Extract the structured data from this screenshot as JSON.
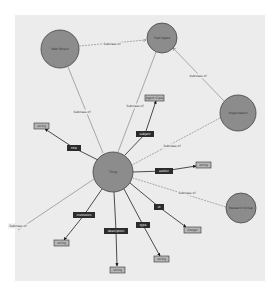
{
  "colors": {
    "background": "#ffffff",
    "panel": "#ececec",
    "class_fill": "#8c8c8c",
    "class_stroke": "#444444",
    "property_fill": "#2b2b2b",
    "datatype_fill": "#b5b5b5",
    "datatype_stroke": "#333333",
    "subclass_edge": "#777777",
    "property_edge": "#222222"
  },
  "classes": [
    {
      "id": "center",
      "label": "Thing",
      "cx": 113,
      "cy": 172,
      "r": 20
    },
    {
      "id": "c1",
      "label": "Web Person",
      "cx": 60,
      "cy": 49,
      "r": 19
    },
    {
      "id": "c2",
      "label": "Foaf Agent",
      "cx": 162,
      "cy": 38,
      "r": 15
    },
    {
      "id": "c3",
      "label": "Organization",
      "cx": 238,
      "cy": 113,
      "r": 18
    },
    {
      "id": "c4",
      "label": "Research Group",
      "cx": 241,
      "cy": 208,
      "r": 15
    }
  ],
  "subclass_edges": [
    {
      "from": "c1",
      "to": "c2",
      "label": "Subclass of",
      "lx": 112,
      "ly": 44
    },
    {
      "from": "center",
      "to": "c1",
      "label": "Subclass of",
      "lx": 82,
      "ly": 112
    },
    {
      "from": "center",
      "to": "c2",
      "label": "Subclass of",
      "lx": 135,
      "ly": 106
    },
    {
      "from": "c3",
      "to": "c2",
      "label": "Subclass of",
      "lx": 198,
      "ly": 76
    },
    {
      "from": "c3",
      "to": "center",
      "label": "Subclass of",
      "lx": 172,
      "ly": 146
    },
    {
      "from": "c4",
      "to": "center",
      "label": "Subclass of",
      "lx": 187,
      "ly": 193
    },
    {
      "from": "center",
      "to": "ext",
      "label": "Subclass of",
      "lx": 18,
      "ly": 226
    }
  ],
  "properties": [
    {
      "label": "title",
      "px": 74,
      "py": 148,
      "target": "string",
      "tx": 41,
      "ty": 126
    },
    {
      "label": "subject",
      "px": 145,
      "py": 134,
      "target": "Agent Class",
      "tx": 154,
      "ty": 98
    },
    {
      "label": "author",
      "px": 164,
      "py": 171,
      "target": "string",
      "tx": 202,
      "ty": 165
    },
    {
      "label": "institution",
      "px": 84,
      "py": 215,
      "target": "string",
      "tx": 61,
      "ty": 242
    },
    {
      "label": "description",
      "px": 116,
      "py": 231,
      "target": "string",
      "tx": 117,
      "ty": 270
    },
    {
      "label": "id",
      "px": 159,
      "py": 207,
      "target": "integer",
      "tx": 188,
      "ty": 230
    },
    {
      "label": "type",
      "px": 143,
      "py": 225,
      "target": "string",
      "tx": 162,
      "ty": 259
    }
  ]
}
